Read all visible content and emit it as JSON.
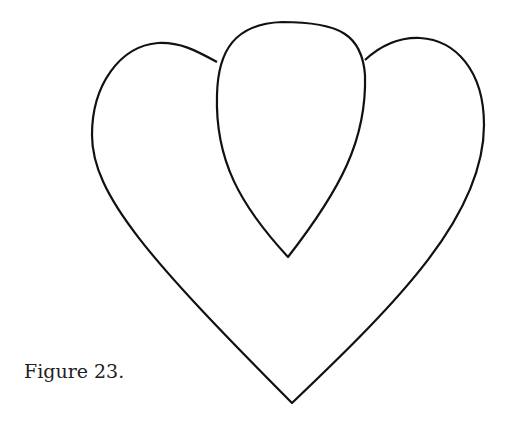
{
  "figure": {
    "caption": "Figure 23.",
    "stroke_color": "#111111",
    "background": "#ffffff"
  }
}
